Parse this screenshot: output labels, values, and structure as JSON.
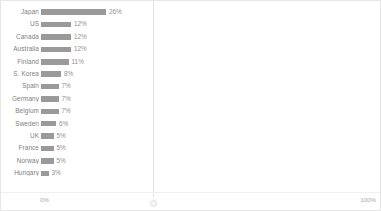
{
  "chart_data": {
    "type": "bar",
    "orientation": "horizontal",
    "title": "",
    "xlabel": "",
    "ylabel": "",
    "xlim": [
      0,
      100
    ],
    "grid": false,
    "legend": null,
    "categories": [
      "Japan",
      "US",
      "Canada",
      "Australia",
      "Finland",
      "S. Korea",
      "Spain",
      "Germany",
      "Belgium",
      "Sweden",
      "UK",
      "France",
      "Norway",
      "Hungary"
    ],
    "values": [
      26,
      12,
      12,
      12,
      11,
      8,
      7,
      7,
      7,
      6,
      5,
      5,
      5,
      3
    ],
    "value_labels": [
      "26%",
      "12%",
      "12%",
      "12%",
      "11%",
      "8%",
      "7%",
      "7%",
      "7%",
      "6%",
      "5%",
      "5%",
      "5%",
      "3%"
    ],
    "axis_ticks": [
      "0%",
      "100%"
    ],
    "bar_color": "#9a9a9a",
    "label_color": "#808080",
    "value_color": "#919191",
    "axis_color": "#e2e2e2"
  },
  "axis": {
    "min_label": "0%",
    "max_label": "100%"
  },
  "icons": {
    "axis_handle": "axis-handle-marker"
  }
}
